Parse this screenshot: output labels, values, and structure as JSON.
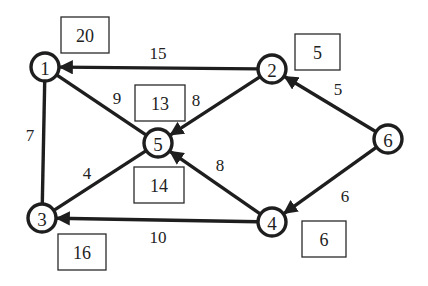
{
  "diagram": {
    "type": "directed weighted graph with node value boxes",
    "nodes": [
      {
        "id": "1",
        "label": "1",
        "x": 45,
        "y": 67
      },
      {
        "id": "2",
        "label": "2",
        "x": 272,
        "y": 69
      },
      {
        "id": "3",
        "label": "3",
        "x": 42,
        "y": 218
      },
      {
        "id": "4",
        "label": "4",
        "x": 272,
        "y": 222
      },
      {
        "id": "5",
        "label": "5",
        "x": 158,
        "y": 143
      },
      {
        "id": "6",
        "label": "6",
        "x": 388,
        "y": 139
      }
    ],
    "edges": [
      {
        "from": "2",
        "to": "1",
        "weight": "15",
        "directed": true,
        "label_x": 158,
        "label_y": 53
      },
      {
        "from": "1",
        "to": "5",
        "weight": "9",
        "directed": false,
        "label_x": 117,
        "label_y": 98
      },
      {
        "from": "2",
        "to": "5",
        "weight": "8",
        "directed": true,
        "label_x": 196,
        "label_y": 100
      },
      {
        "from": "1",
        "to": "3",
        "weight": "7",
        "directed": false,
        "label_x": 30,
        "label_y": 135
      },
      {
        "from": "5",
        "to": "3",
        "weight": "4",
        "directed": false,
        "label_x": 87,
        "label_y": 173
      },
      {
        "from": "4",
        "to": "5",
        "weight": "8",
        "directed": true,
        "label_x": 220,
        "label_y": 165
      },
      {
        "from": "4",
        "to": "3",
        "weight": "10",
        "directed": true,
        "label_x": 158,
        "label_y": 237
      },
      {
        "from": "6",
        "to": "2",
        "weight": "5",
        "directed": true,
        "label_x": 338,
        "label_y": 89
      },
      {
        "from": "6",
        "to": "4",
        "weight": "6",
        "directed": true,
        "label_x": 345,
        "label_y": 196
      }
    ],
    "boxes": [
      {
        "node": "1",
        "value": "20",
        "x": 61,
        "y": 17,
        "w": 48,
        "h": 36
      },
      {
        "node": "2",
        "value": "5",
        "x": 295,
        "y": 34,
        "w": 45,
        "h": 36
      },
      {
        "node": "5",
        "value": "13",
        "x": 135,
        "y": 85,
        "w": 50,
        "h": 36
      },
      {
        "node": "5",
        "value": "14",
        "x": 134,
        "y": 167,
        "w": 50,
        "h": 36
      },
      {
        "node": "3",
        "value": "16",
        "x": 58,
        "y": 234,
        "w": 48,
        "h": 36
      },
      {
        "node": "4",
        "value": "6",
        "x": 302,
        "y": 221,
        "w": 44,
        "h": 36
      }
    ]
  }
}
